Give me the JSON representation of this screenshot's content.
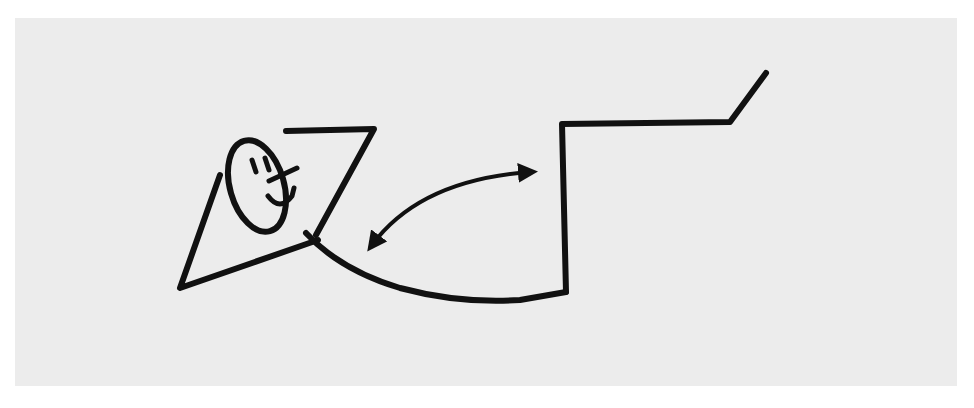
{
  "figure": {
    "background_color": "#ececec",
    "ink_color": "#111111",
    "caption": ""
  },
  "elements": [
    {
      "name": "smiley-face",
      "shape": "ellipse"
    },
    {
      "name": "reclining-triangle-body",
      "shape": "polyline"
    },
    {
      "name": "connecting-curve",
      "shape": "path"
    },
    {
      "name": "double-headed-arrow",
      "shape": "curved-arrow"
    },
    {
      "name": "stepped-platform",
      "shape": "polyline"
    }
  ]
}
